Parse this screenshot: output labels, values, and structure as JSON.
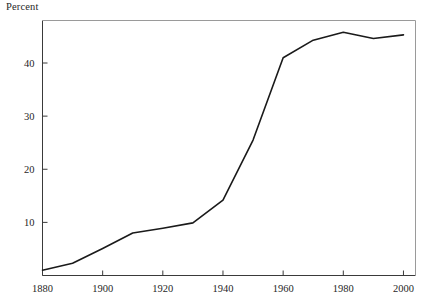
{
  "chart_data": {
    "type": "line",
    "title": "",
    "subtitle": "",
    "xlabel": "",
    "ylabel": "Percent",
    "xlim": [
      1880,
      2004
    ],
    "ylim": [
      0,
      48
    ],
    "grid": false,
    "legend": null,
    "xticks": [
      1880,
      1900,
      1920,
      1940,
      1960,
      1980,
      2000
    ],
    "xtick_labels": [
      "1880",
      "1900",
      "1920",
      "1940",
      "1960",
      "1980",
      "2000"
    ],
    "yticks": [
      10,
      20,
      30,
      40
    ],
    "ytick_labels": [
      "10",
      "20",
      "30",
      "40"
    ],
    "series": [
      {
        "name": "Percent",
        "color": "#1a1a1a",
        "x": [
          1880,
          1890,
          1900,
          1910,
          1920,
          1930,
          1940,
          1950,
          1960,
          1970,
          1980,
          1990,
          2000
        ],
        "values": [
          1.0,
          2.3,
          5.1,
          8.0,
          8.9,
          9.9,
          14.2,
          25.5,
          41.0,
          44.3,
          45.8,
          44.6,
          45.3
        ]
      }
    ]
  },
  "labels": {
    "percent_axis_label": "Percent"
  }
}
